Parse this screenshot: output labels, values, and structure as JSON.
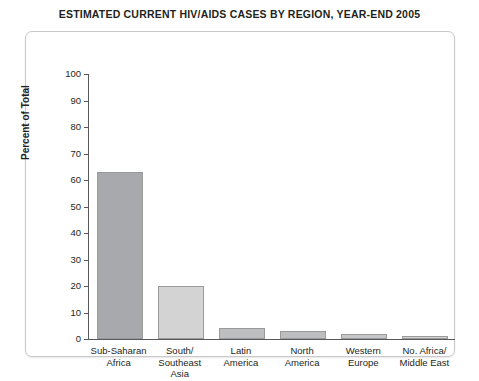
{
  "chart_data": {
    "type": "bar",
    "title": "ESTIMATED CURRENT HIV/AIDS CASES BY REGION, YEAR-END 2005",
    "xlabel": "",
    "ylabel": "Percent of Total",
    "categories": [
      "Sub-Saharan\nAfrica",
      "South/\nSoutheast\nAsia",
      "Latin\nAmerica",
      "North\nAmerica",
      "Western\nEurope",
      "No. Africa/\nMiddle East"
    ],
    "values": [
      63,
      20,
      4,
      3,
      2,
      1
    ],
    "ylim": [
      0,
      100
    ],
    "yticks": [
      0,
      10,
      20,
      30,
      40,
      50,
      60,
      70,
      80,
      90,
      100
    ],
    "ytick_labels": [
      "0",
      "10",
      "20",
      "30",
      "40",
      "50",
      "60",
      "70",
      "80",
      "90",
      "100"
    ],
    "grid": false,
    "legend": "none",
    "bar_colors": [
      "#a7a9ac",
      "#d3d3d3",
      "#bcbec0",
      "#bcbec0",
      "#c5c7c9",
      "#cfd1d2"
    ],
    "axis_color": "#58595b",
    "background": "#ffffff"
  }
}
